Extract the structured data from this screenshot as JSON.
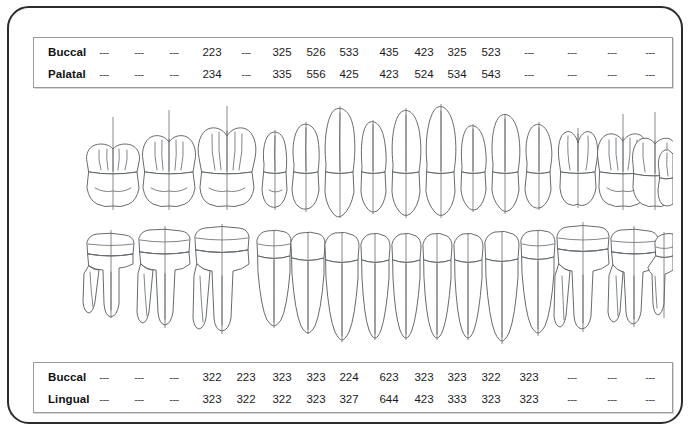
{
  "chart_data": {
    "type": "table",
    "upper_arch": {
      "rows": [
        {
          "label": "Buccal",
          "values": [
            "---",
            "---",
            "---",
            "223",
            "---",
            "325",
            "526",
            "533",
            "435",
            "423",
            "325",
            "523",
            "---",
            "---",
            "---",
            "---"
          ]
        },
        {
          "label": "Palatal",
          "values": [
            "---",
            "---",
            "---",
            "234",
            "---",
            "335",
            "556",
            "425",
            "423",
            "524",
            "534",
            "543",
            "---",
            "---",
            "---",
            "---"
          ]
        }
      ]
    },
    "lower_arch": {
      "rows": [
        {
          "label": "Buccal",
          "values": [
            "---",
            "---",
            "---",
            "322",
            "223",
            "323",
            "323",
            "224",
            "623",
            "323",
            "323",
            "322",
            "323",
            "---",
            "---",
            "---"
          ]
        },
        {
          "label": "Lingual",
          "values": [
            "---",
            "---",
            "---",
            "323",
            "322",
            "322",
            "323",
            "327",
            "644",
            "423",
            "333",
            "323",
            "323",
            "---",
            "---",
            "---"
          ]
        }
      ]
    },
    "tooth_count_per_arch": 16,
    "colors": {
      "frame_border": "#2b2b2b",
      "table_border": "#9a9a9a",
      "tooth_stroke": "#555a5e",
      "text": "#111111",
      "background": "#ffffff"
    }
  },
  "diagram": {
    "upper_arch_name": "maxillary-arch",
    "lower_arch_name": "mandibular-arch"
  }
}
